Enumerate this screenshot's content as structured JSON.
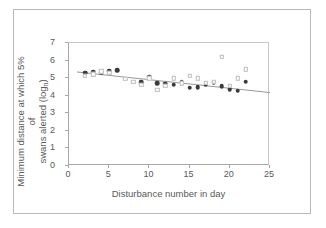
{
  "chart_data": {
    "type": "scatter",
    "title": "",
    "xlabel": "Disturbance number in day",
    "ylabel_line1": "Minimum distance at which 5% of",
    "ylabel_line2": "swans alerted (log",
    "ylabel_sub": "n",
    "ylabel_tail": ")",
    "xlim": [
      0,
      25
    ],
    "ylim": [
      0,
      7
    ],
    "xticks": [
      0,
      5,
      10,
      15,
      20,
      25
    ],
    "yticks": [
      0,
      1,
      2,
      3,
      4,
      5,
      6,
      7
    ],
    "grid": false,
    "legend": "none",
    "series": [
      {
        "name": "observed-filled",
        "marker": "filled-circle",
        "color": "#3a3a3a",
        "points": [
          {
            "x": 2,
            "y": 5.3
          },
          {
            "x": 3,
            "y": 5.33
          },
          {
            "x": 4,
            "y": 5.32
          },
          {
            "x": 5,
            "y": 5.38
          },
          {
            "x": 6,
            "y": 5.45
          },
          {
            "x": 9,
            "y": 4.78
          },
          {
            "x": 10,
            "y": 5.08
          },
          {
            "x": 11,
            "y": 4.7
          },
          {
            "x": 12,
            "y": 4.68
          },
          {
            "x": 13,
            "y": 4.62
          },
          {
            "x": 14,
            "y": 4.8
          },
          {
            "x": 15,
            "y": 4.46
          },
          {
            "x": 16,
            "y": 4.47
          },
          {
            "x": 17,
            "y": 4.63
          },
          {
            "x": 18,
            "y": 4.73
          },
          {
            "x": 19,
            "y": 4.55
          },
          {
            "x": 20,
            "y": 4.36
          },
          {
            "x": 21,
            "y": 4.28
          },
          {
            "x": 22,
            "y": 4.8
          }
        ]
      },
      {
        "name": "observed-open",
        "marker": "open-square",
        "color": "#bdbdbd",
        "points": [
          {
            "x": 2,
            "y": 5.15
          },
          {
            "x": 3,
            "y": 5.22
          },
          {
            "x": 4,
            "y": 5.38
          },
          {
            "x": 5,
            "y": 5.3
          },
          {
            "x": 7,
            "y": 4.95
          },
          {
            "x": 8,
            "y": 4.8
          },
          {
            "x": 9,
            "y": 4.63
          },
          {
            "x": 10,
            "y": 5.0
          },
          {
            "x": 11,
            "y": 4.32
          },
          {
            "x": 12,
            "y": 4.55
          },
          {
            "x": 13,
            "y": 5.0
          },
          {
            "x": 14,
            "y": 4.7
          },
          {
            "x": 15,
            "y": 5.15
          },
          {
            "x": 16,
            "y": 5.0
          },
          {
            "x": 17,
            "y": 4.72
          },
          {
            "x": 18,
            "y": 4.8
          },
          {
            "x": 19,
            "y": 6.2
          },
          {
            "x": 20,
            "y": 4.58
          },
          {
            "x": 21,
            "y": 5.0
          },
          {
            "x": 22,
            "y": 5.5
          }
        ]
      }
    ],
    "trendline": {
      "name": "linear-fit",
      "color": "#8c8c8c",
      "x_start": 1.0,
      "y_start": 5.35,
      "x_end": 25.0,
      "y_end": 4.18
    }
  }
}
